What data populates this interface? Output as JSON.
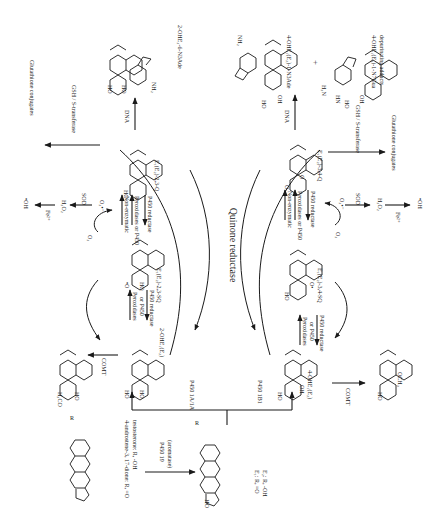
{
  "diagram": {
    "orientation": "rotated 90deg clockwise (text reads top-to-bottom)",
    "center_label": "Quinone reductase",
    "precursor": {
      "name": "4-androstene-3, 17-dione: R, =O",
      "name_line2": "testosterone: R, -OH",
      "enzyme": "P450 19",
      "enzyme_note": "(aromatase)"
    },
    "estrogen": {
      "label_line1": "E₁: R, =O",
      "label_line2": "E₂: R, -OH",
      "substituent_label": "HO",
      "r_label": "R",
      "ring_numbers": [
        "1",
        "2",
        "3",
        "4",
        "5",
        "6",
        "7",
        "8",
        "9",
        "10",
        "11",
        "12",
        "13",
        "14",
        "15",
        "16",
        "17"
      ]
    },
    "left_branch": {
      "enzyme": "P450 1A/1A",
      "catechol": "2-OHE₁(E₂)",
      "methylation_enzyme": "COMT",
      "methoxy_product_label": "H₃CO",
      "semiquinone": "E₁(E₂)-2,3-SQ",
      "semiquinone_radical": "•O",
      "quinone": "E₁(E₂)-2,3-Q",
      "oxidation_enzyme_1": "Peroxidases",
      "oxidation_enzyme_1b": "or P450",
      "reduction_enzyme_1": "P450 reductase",
      "oxidation_nonenzymatic": "Non-enzymatic",
      "oxidation_enzyme_2": "Peroxidases or P450",
      "reduction_enzyme_2": "P450 reductase",
      "oxygen": "O₂",
      "superoxide": "O₂•⁻",
      "sod": "SOD",
      "peroxide": "H₂O₂",
      "iron": "Fe²⁺",
      "radical": "•OH",
      "gsh": "GSH / S-transferase",
      "conjugates": "Glutathione conjugates",
      "dna": "DNA",
      "adduct": "2-OHE₂-6-N3Ade",
      "adduct_nh2": "NH₂",
      "ho_label": "HO"
    },
    "right_branch": {
      "enzyme": "P450 1B1",
      "catechol": "4-OHE₁(E₂)",
      "methylation_enzyme": "COMT",
      "methoxy_product_label": "OCH₃",
      "semiquinone": "E₁(E₂)-3,4-SQ",
      "semiquinone_radical": "O•",
      "quinone": "E₁(E₂)-3,4-Q",
      "oxidation_enzyme_1": "Peroxidases",
      "oxidation_enzyme_1b": "or P450",
      "reduction_enzyme_1": "P450 reductase",
      "oxidation_nonenzymatic": "Non-enzymatic",
      "oxidation_enzyme_2": "Peroxidases or P450",
      "reduction_enzyme_2": "P450 reductase",
      "oxygen": "O₂",
      "superoxide": "O₂•⁻",
      "sod": "SOD",
      "peroxide": "H₂O₂",
      "iron": "Fe²⁺",
      "radical": "•OH",
      "gsh": "GSH / S-transferase",
      "conjugates": "Glutathione conjugates",
      "dna": "DNA",
      "adduct_1": "4-OHE₁(E₂)-1-N3Ade",
      "adduct_2": "4-OHE₁(E₂)-1-N7Gua",
      "adduct_note": "depurinating adducts",
      "plus": "+",
      "adduct_nh2": "NH₂",
      "guanine_h2n": "H₂N",
      "guanine_hn": "HN",
      "guanine_o": "O",
      "oh_label": "OH",
      "ho_label": "HO"
    }
  }
}
